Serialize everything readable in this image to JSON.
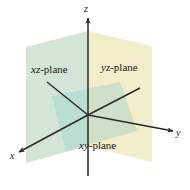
{
  "figure": {
    "background": "#ffffff",
    "width": 190,
    "height": 190,
    "origin": {
      "x": 88,
      "y": 115
    }
  },
  "planes": [
    {
      "id": "xz-plane",
      "label": "xz-plane",
      "color": "#cfe3d2",
      "opacity": 0.85,
      "orientation": "vertical-left"
    },
    {
      "id": "yz-plane",
      "label": "yz-plane",
      "color": "#f2ecc9",
      "opacity": 0.85,
      "orientation": "vertical-right"
    },
    {
      "id": "xy-plane",
      "label": "xy-plane",
      "color": "#c6e4de",
      "opacity": 0.85,
      "orientation": "horizontal"
    }
  ],
  "axes": [
    {
      "id": "x-axis",
      "label": "x",
      "direction": "down-left",
      "color": "#2b2b2b",
      "arrow": true
    },
    {
      "id": "y-axis",
      "label": "y",
      "direction": "right",
      "color": "#2b2b2b",
      "arrow": true
    },
    {
      "id": "z-axis",
      "label": "z",
      "direction": "up",
      "color": "#2b2b2b",
      "arrow": true
    }
  ],
  "colors": {
    "axis": "#2b2b2b",
    "text": "#1a1a1a",
    "green": "#cfe3d2",
    "cream": "#f2ecc9",
    "teal": "#c6e4de"
  }
}
